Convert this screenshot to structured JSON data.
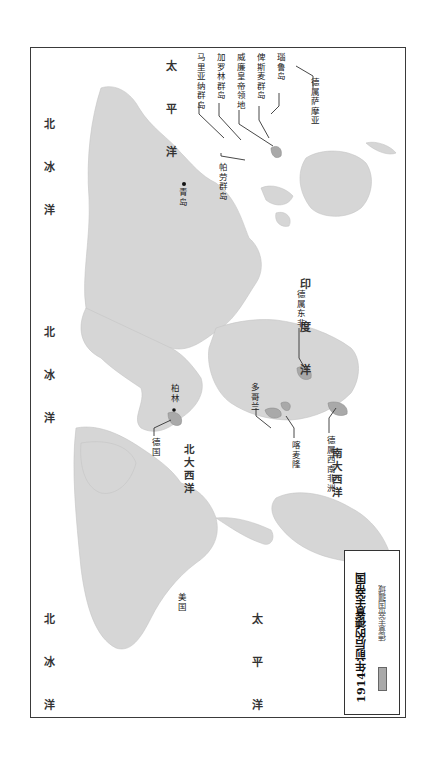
{
  "map": {
    "title": "1914年前后的德意志帝国",
    "legend": {
      "swatch_label": "德意志帝国疆域",
      "swatch_color": "#a9a9a9"
    },
    "colors": {
      "land": "#d6d6d6",
      "german_territory": "#a9a9a9",
      "ocean": "#ffffff",
      "frame": "#3a3a3a"
    },
    "oceans": {
      "arctic_top": "北 冰 洋",
      "pacific_top": "太 平 洋",
      "arctic_middle": "北 冰 洋",
      "indian": "印 度 洋",
      "north_atlantic": "北大西洋",
      "south_atlantic": "南大西洋",
      "arctic_bottom": "北 冰 洋",
      "pacific_bottom": "太 平 洋"
    },
    "places": {
      "mariana": "马里亚纳群岛",
      "caroline": "加罗林群岛",
      "kaiser_wilhelmsland": "威廉皇帝领地",
      "bismarck": "俾斯麦群岛",
      "nauru": "瑙鲁岛",
      "samoa": "德属萨摩亚",
      "palau": "帕劳群岛",
      "qingdao": "青岛",
      "east_africa": "德属东非",
      "germany": "德国",
      "berlin": "柏林",
      "togo": "多哥兰",
      "cameroon": "喀麦隆",
      "southwest_africa": "德属西南非洲",
      "usa": "美国"
    }
  }
}
